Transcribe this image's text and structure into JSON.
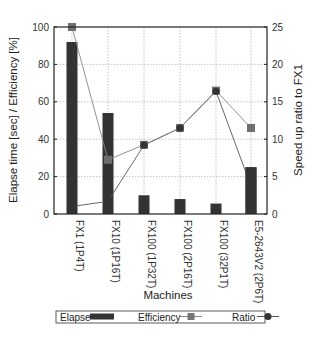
{
  "chart_data": {
    "type": "bar",
    "categories": [
      "FX1 (1P4T)",
      "FX10 (1P16T)",
      "FX100 (1P32T)",
      "FX100 (2P16T)",
      "FX100 (32P1T)",
      "E5-2643V2 (2P6T)"
    ],
    "series": [
      {
        "name": "Elapse",
        "type": "bar",
        "axis": "left",
        "color": "#333333",
        "values": [
          92,
          54,
          10,
          8,
          5.6,
          25
        ]
      },
      {
        "name": "Efficiency",
        "type": "line",
        "marker": "square",
        "axis": "left",
        "color": "#888888",
        "values": [
          100,
          29,
          37,
          46,
          66,
          46
        ]
      },
      {
        "name": "Ratio",
        "type": "line",
        "marker": "circle",
        "axis": "right",
        "color": "#555555",
        "values": [
          1.0,
          1.7,
          9.2,
          11.5,
          16.4,
          3.7
        ]
      }
    ],
    "title": "",
    "xlabel": "Machines",
    "ylabel": "Elapse time [sec] / Efficiency [%]",
    "y2label": "Speed up ratio to FX1",
    "ylim": [
      0,
      100
    ],
    "y2lim": [
      0,
      25
    ],
    "yticks": [
      0,
      20,
      40,
      60,
      80,
      100
    ],
    "y2ticks": [
      0,
      5,
      10,
      15,
      20,
      25
    ],
    "grid": true,
    "legend_position": "bottom",
    "legend": [
      "Elapse",
      "Efficiency",
      "Ratio"
    ]
  },
  "labels": {
    "xlabel": "Machines",
    "ylabel": "Elapse time [sec] / Efficiency [%]",
    "y2label": "Speed up ratio to FX1",
    "legend_elapse": "Elapse",
    "legend_efficiency": "Efficiency",
    "legend_ratio": "Ratio"
  }
}
